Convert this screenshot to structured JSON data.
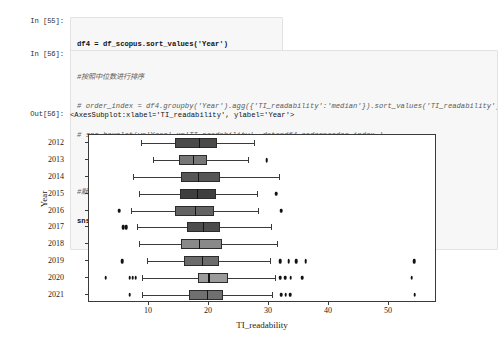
{
  "notebook": {
    "cells": [
      {
        "type": "input",
        "prompt": "In  [55]:",
        "lines": [
          {
            "text": "df4 = df_scopus.sort_values('Year')",
            "style": "code"
          },
          {
            "text": "df4['Year'] = df4['Year'].map(str)",
            "style": "code"
          }
        ]
      },
      {
        "type": "input",
        "prompt": "In  [56]:",
        "lines": [
          {
            "text": "#按照中位数进行排序",
            "style": "comment"
          },
          {
            "text": "# order_index = df4.groupby('Year').agg({'TI_readability':'median'}).sort_values('TI_readability').index",
            "style": "comment"
          },
          {
            "text": "# sns.boxplot(y='Year',x='TI_readability', data=df4,order=order_index )",
            "style": "comment"
          },
          {
            "text": "",
            "style": "code"
          },
          {
            "text": "#默认按照年份进行排序",
            "style": "comment"
          },
          {
            "text": "sns.boxplot(y='Year',x='TI_readability',data=df4)",
            "style": "code"
          }
        ]
      },
      {
        "type": "output",
        "prompt": "Out[56]:",
        "lines": [
          {
            "text": "<AxesSubplot:xlabel='TI_readability', ylabel='Year'>",
            "style": "code"
          }
        ]
      }
    ]
  },
  "chart_data": {
    "type": "box",
    "title": "",
    "xlabel": "TI_readability",
    "ylabel": "Year",
    "xlim": [
      0,
      58
    ],
    "ylim_categories": [
      "2012",
      "2013",
      "2014",
      "2015",
      "2016",
      "2017",
      "2018",
      "2019",
      "2020",
      "2021"
    ],
    "xticks": [
      10,
      20,
      30,
      40,
      50
    ],
    "yticks": [
      "2012",
      "2013",
      "2014",
      "2015",
      "2016",
      "2017",
      "2018",
      "2019",
      "2020",
      "2021"
    ],
    "grid": false,
    "legend": null,
    "orientation": "horizontal",
    "boxes": [
      {
        "category": "2012",
        "whisker_low": 8.6,
        "q1": 14.4,
        "median": 18.3,
        "q3": 21.3,
        "whisker_high": 27.5,
        "fill": "#4a4a4a",
        "fliers": []
      },
      {
        "category": "2013",
        "whisker_low": 10.6,
        "q1": 15.0,
        "median": 17.3,
        "q3": 19.6,
        "whisker_high": 26.5,
        "fill": "#777777",
        "fliers": [
          29.6
        ]
      },
      {
        "category": "2014",
        "whisker_low": 7.4,
        "q1": 15.3,
        "median": 18.1,
        "q3": 21.8,
        "whisker_high": 31.6,
        "fill": "#565656",
        "fliers": []
      },
      {
        "category": "2015",
        "whisker_low": 8.3,
        "q1": 15.1,
        "median": 18.0,
        "q3": 21.2,
        "whisker_high": 28.0,
        "fill": "#3f3f3f",
        "fliers": [
          31.2
        ]
      },
      {
        "category": "2016",
        "whisker_low": 7.0,
        "q1": 14.3,
        "median": 17.6,
        "q3": 20.8,
        "whisker_high": 28.1,
        "fill": "#636363",
        "fliers": [
          5.0,
          32.0
        ]
      },
      {
        "category": "2017",
        "whisker_low": 8.0,
        "q1": 16.4,
        "median": 19.0,
        "q3": 21.9,
        "whisker_high": 30.4,
        "fill": "#4c4c4c",
        "fliers": [
          5.7,
          6.2
        ]
      },
      {
        "category": "2018",
        "whisker_low": 8.4,
        "q1": 15.4,
        "median": 18.3,
        "q3": 22.1,
        "whisker_high": 31.3,
        "fill": "#898989",
        "fliers": []
      },
      {
        "category": "2019",
        "whisker_low": 9.6,
        "q1": 15.9,
        "median": 18.8,
        "q3": 21.6,
        "whisker_high": 30.2,
        "fill": "#6b6b6b",
        "fliers": [
          5.5,
          31.9,
          33.3,
          34.5,
          36.1,
          54.2
        ]
      },
      {
        "category": "2020",
        "whisker_low": 8.8,
        "q1": 18.2,
        "median": 19.9,
        "q3": 23.1,
        "whisker_high": 31.0,
        "fill": "#9b9b9b",
        "fliers": [
          2.8,
          6.8,
          31.9,
          32.7,
          33.6,
          35.5,
          53.8
        ],
        "extra_fliers": [
          7.3,
          7.8
        ]
      },
      {
        "category": "2021",
        "whisker_low": 8.9,
        "q1": 16.7,
        "median": 19.6,
        "q3": 22.3,
        "whisker_high": 30.5,
        "fill": "#707070",
        "fliers": [
          6.8,
          32.0,
          32.8,
          33.5,
          54.3
        ]
      }
    ]
  }
}
